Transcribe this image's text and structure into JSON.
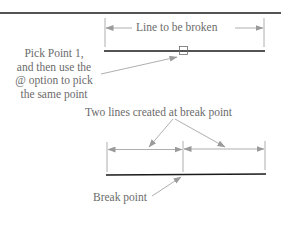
{
  "diagram": {
    "top_dimension_label": "Line to be broken",
    "pick_point_label": [
      "Pick Point 1,",
      "and then use the",
      "@ option to pick",
      "the same point"
    ],
    "two_lines_label": "Two lines created at break point",
    "break_point_label": "Break point"
  },
  "colors": {
    "line": "#1a1a1a",
    "annotation": "#8a8a8a",
    "text": "#6b6b6b"
  }
}
